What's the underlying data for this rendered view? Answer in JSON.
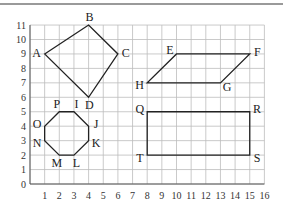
{
  "diagram": {
    "type": "coordinate-grid-shapes",
    "grid": {
      "xmin": 0,
      "xmax": 16,
      "ymin": 0,
      "ymax": 11,
      "origin_px": [
        30,
        184
      ],
      "unit_px": [
        14.65,
        14.45
      ]
    },
    "x_tick_labels": [
      "1",
      "2",
      "3",
      "4",
      "5",
      "6",
      "7",
      "8",
      "9",
      "10",
      "11",
      "12",
      "13",
      "14",
      "15",
      "16"
    ],
    "y_tick_labels": [
      "0",
      "1",
      "2",
      "3",
      "4",
      "5",
      "6",
      "7",
      "8",
      "9",
      "10",
      "11"
    ],
    "shapes": [
      {
        "name": "kite",
        "vertices": [
          {
            "label": "A",
            "x": 1,
            "y": 9
          },
          {
            "label": "B",
            "x": 4,
            "y": 11
          },
          {
            "label": "C",
            "x": 6,
            "y": 9
          },
          {
            "label": "D",
            "x": 4,
            "y": 6
          }
        ]
      },
      {
        "name": "parallelogram",
        "vertices": [
          {
            "label": "E",
            "x": 10,
            "y": 9
          },
          {
            "label": "F",
            "x": 15,
            "y": 9
          },
          {
            "label": "G",
            "x": 13,
            "y": 7
          },
          {
            "label": "H",
            "x": 8,
            "y": 7
          }
        ]
      },
      {
        "name": "octagon",
        "vertices": [
          {
            "label": "P",
            "x": 2,
            "y": 5
          },
          {
            "label": "I",
            "x": 3,
            "y": 5
          },
          {
            "label": "J",
            "x": 4,
            "y": 4
          },
          {
            "label": "K",
            "x": 4,
            "y": 3
          },
          {
            "label": "L",
            "x": 3,
            "y": 2
          },
          {
            "label": "M",
            "x": 2,
            "y": 2
          },
          {
            "label": "N",
            "x": 1,
            "y": 3
          },
          {
            "label": "O",
            "x": 1,
            "y": 4
          }
        ]
      },
      {
        "name": "rectangle",
        "vertices": [
          {
            "label": "Q",
            "x": 8,
            "y": 5
          },
          {
            "label": "R",
            "x": 15,
            "y": 5
          },
          {
            "label": "S",
            "x": 15,
            "y": 2
          },
          {
            "label": "T",
            "x": 8,
            "y": 2
          }
        ]
      }
    ],
    "colors": {
      "grid": "#bdbdbd",
      "axis": "#555555",
      "shape": "#222222",
      "top_rule": "#9a9a9a"
    }
  }
}
